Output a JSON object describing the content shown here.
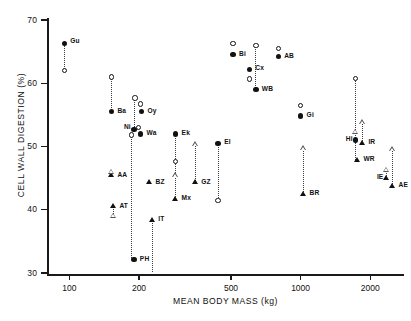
{
  "chart_data": {
    "type": "scatter",
    "title": "",
    "xlabel": "MEAN BODY MASS (kg)",
    "ylabel": "CELL WALL DIGESTION (%)",
    "xscale": "log",
    "yscale": "linear",
    "xlim": [
      80,
      2800
    ],
    "ylim": [
      28,
      71
    ],
    "grid": false,
    "legend_position": "none",
    "xticks": [
      100,
      200,
      500,
      1000,
      2000
    ],
    "xtick_labels": [
      "100",
      "200",
      "500",
      "1000",
      "2000"
    ],
    "yticks": [
      30,
      40,
      50,
      60,
      70
    ],
    "ytick_labels": [
      "30",
      "40",
      "50",
      "60",
      "70"
    ],
    "marker_types": [
      "filled-circle",
      "open-circle",
      "filled-triangle",
      "open-triangle"
    ],
    "points": [
      {
        "label": "Gu",
        "x": 95,
        "y": 66.3,
        "marker": "filled-circle",
        "lx": 6,
        "ly": -4
      },
      {
        "label": "",
        "x": 95,
        "y": 62.0,
        "marker": "open-circle",
        "lx": 0,
        "ly": 0
      },
      {
        "label": "Ba",
        "x": 152,
        "y": 55.5,
        "marker": "filled-circle",
        "lx": 6,
        "ly": -3
      },
      {
        "label": "",
        "x": 152,
        "y": 61.0,
        "marker": "open-circle",
        "lx": 0,
        "ly": 0
      },
      {
        "label": "AA",
        "x": 152,
        "y": 45.4,
        "marker": "filled-triangle",
        "lx": 6,
        "ly": -3
      },
      {
        "label": "",
        "x": 152,
        "y": 46.0,
        "marker": "open-triangle",
        "lx": 0,
        "ly": 0
      },
      {
        "label": "AT",
        "x": 155,
        "y": 40.5,
        "marker": "filled-triangle",
        "lx": 6,
        "ly": -3
      },
      {
        "label": "",
        "x": 155,
        "y": 39.0,
        "marker": "open-triangle",
        "lx": 0,
        "ly": 0
      },
      {
        "label": "Ni",
        "x": 190,
        "y": 52.7,
        "marker": "filled-circle",
        "lx": -11,
        "ly": -4
      },
      {
        "label": "",
        "x": 186,
        "y": 51.8,
        "marker": "open-circle",
        "lx": 0,
        "ly": 0
      },
      {
        "label": "",
        "x": 192,
        "y": 57.7,
        "marker": "open-circle",
        "lx": 0,
        "ly": 0
      },
      {
        "label": "Oy",
        "x": 205,
        "y": 55.5,
        "marker": "filled-circle",
        "lx": 6,
        "ly": -3
      },
      {
        "label": "",
        "x": 203,
        "y": 56.7,
        "marker": "open-circle",
        "lx": 0,
        "ly": 0
      },
      {
        "label": "Wa",
        "x": 203,
        "y": 52.0,
        "marker": "filled-circle",
        "lx": 6,
        "ly": -3
      },
      {
        "label": "",
        "x": 199,
        "y": 53.0,
        "marker": "open-circle",
        "lx": 0,
        "ly": 0
      },
      {
        "label": "PH",
        "x": 190,
        "y": 32.1,
        "marker": "filled-circle",
        "lx": 6,
        "ly": -3
      },
      {
        "label": "BZ",
        "x": 222,
        "y": 44.3,
        "marker": "filled-triangle",
        "lx": 6,
        "ly": -3
      },
      {
        "label": "IT",
        "x": 228,
        "y": 38.4,
        "marker": "filled-triangle",
        "lx": 6,
        "ly": -3
      },
      {
        "label": "Ek",
        "x": 288,
        "y": 52.0,
        "marker": "filled-circle",
        "lx": 6,
        "ly": -3
      },
      {
        "label": "",
        "x": 288,
        "y": 47.6,
        "marker": "open-circle",
        "lx": 0,
        "ly": 0
      },
      {
        "label": "Mx",
        "x": 288,
        "y": 41.7,
        "marker": "filled-triangle",
        "lx": 6,
        "ly": -3
      },
      {
        "label": "",
        "x": 288,
        "y": 45.4,
        "marker": "open-triangle",
        "lx": 0,
        "ly": 0
      },
      {
        "label": "GZ",
        "x": 350,
        "y": 44.3,
        "marker": "filled-triangle",
        "lx": 6,
        "ly": -3
      },
      {
        "label": "",
        "x": 350,
        "y": 50.3,
        "marker": "open-triangle",
        "lx": 0,
        "ly": 0
      },
      {
        "label": "El",
        "x": 440,
        "y": 50.5,
        "marker": "filled-circle",
        "lx": 6,
        "ly": -3
      },
      {
        "label": "",
        "x": 440,
        "y": 41.5,
        "marker": "open-circle",
        "lx": 0,
        "ly": 0
      },
      {
        "label": "Bi",
        "x": 510,
        "y": 64.5,
        "marker": "filled-circle",
        "lx": 6,
        "ly": -3
      },
      {
        "label": "",
        "x": 510,
        "y": 66.3,
        "marker": "open-circle",
        "lx": 0,
        "ly": 0
      },
      {
        "label": "Cx",
        "x": 600,
        "y": 62.2,
        "marker": "filled-circle",
        "lx": 6,
        "ly": -3
      },
      {
        "label": "",
        "x": 600,
        "y": 60.7,
        "marker": "open-circle",
        "lx": 0,
        "ly": 0
      },
      {
        "label": "WB",
        "x": 640,
        "y": 59.0,
        "marker": "filled-circle",
        "lx": 6,
        "ly": -3
      },
      {
        "label": "",
        "x": 640,
        "y": 66.0,
        "marker": "open-circle",
        "lx": 0,
        "ly": 0
      },
      {
        "label": "AB",
        "x": 800,
        "y": 64.2,
        "marker": "filled-circle",
        "lx": 6,
        "ly": -3
      },
      {
        "label": "",
        "x": 800,
        "y": 65.5,
        "marker": "open-circle",
        "lx": 0,
        "ly": 0
      },
      {
        "label": "Gi",
        "x": 1000,
        "y": 54.8,
        "marker": "filled-circle",
        "lx": 6,
        "ly": -3
      },
      {
        "label": "",
        "x": 1000,
        "y": 56.5,
        "marker": "open-circle",
        "lx": 0,
        "ly": 0
      },
      {
        "label": "BR",
        "x": 1030,
        "y": 42.5,
        "marker": "filled-triangle",
        "lx": 6,
        "ly": -3
      },
      {
        "label": "",
        "x": 1030,
        "y": 49.7,
        "marker": "open-triangle",
        "lx": 0,
        "ly": 0
      },
      {
        "label": "Hi",
        "x": 1730,
        "y": 51.0,
        "marker": "filled-circle",
        "lx": -12,
        "ly": -3
      },
      {
        "label": "",
        "x": 1730,
        "y": 60.8,
        "marker": "open-circle",
        "lx": 0,
        "ly": 0
      },
      {
        "label": "",
        "x": 1730,
        "y": 52.3,
        "marker": "open-triangle",
        "lx": 0,
        "ly": 0
      },
      {
        "label": "IR",
        "x": 1850,
        "y": 50.5,
        "marker": "filled-triangle",
        "lx": 6,
        "ly": -3
      },
      {
        "label": "",
        "x": 1850,
        "y": 53.8,
        "marker": "open-triangle",
        "lx": 0,
        "ly": 0
      },
      {
        "label": "WR",
        "x": 1760,
        "y": 47.8,
        "marker": "filled-triangle",
        "lx": 6,
        "ly": -3
      },
      {
        "label": "IE",
        "x": 2350,
        "y": 45.0,
        "marker": "filled-triangle",
        "lx": -11,
        "ly": -3
      },
      {
        "label": "",
        "x": 2350,
        "y": 46.3,
        "marker": "open-triangle",
        "lx": 0,
        "ly": 0
      },
      {
        "label": "AE",
        "x": 2500,
        "y": 43.7,
        "marker": "filled-triangle",
        "lx": 6,
        "ly": -3
      },
      {
        "label": "",
        "x": 2500,
        "y": 49.5,
        "marker": "open-triangle",
        "lx": 0,
        "ly": 0
      }
    ],
    "connectors": [
      {
        "x": 95,
        "y1": 66.3,
        "y2": 62.0
      },
      {
        "x": 152,
        "y1": 61.0,
        "y2": 55.5
      },
      {
        "x": 186,
        "y1": 52.0,
        "y2": 32.1
      },
      {
        "x": 192,
        "y1": 57.7,
        "y2": 52.7
      },
      {
        "x": 155,
        "y1": 40.5,
        "y2": 39.0
      },
      {
        "x": 228,
        "y1": 38.4,
        "y2": 30.2
      },
      {
        "x": 288,
        "y1": 52.0,
        "y2": 41.7
      },
      {
        "x": 350,
        "y1": 50.3,
        "y2": 44.3
      },
      {
        "x": 440,
        "y1": 50.5,
        "y2": 41.5
      },
      {
        "x": 640,
        "y1": 66.0,
        "y2": 59.0
      },
      {
        "x": 1030,
        "y1": 49.7,
        "y2": 42.5
      },
      {
        "x": 1730,
        "y1": 60.8,
        "y2": 47.8
      },
      {
        "x": 1850,
        "y1": 53.8,
        "y2": 50.5
      },
      {
        "x": 2500,
        "y1": 49.5,
        "y2": 43.7
      },
      {
        "x": 2350,
        "y1": 46.3,
        "y2": 45.0
      }
    ]
  }
}
